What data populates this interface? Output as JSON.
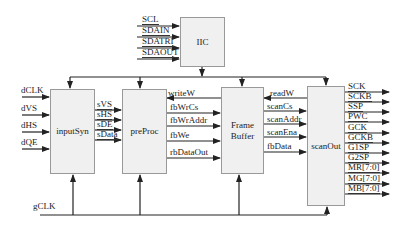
{
  "blocks": {
    "iic": "IIC",
    "inputSyn": "inputSyn",
    "preProc": "preProc",
    "frameBuffer": "Frame\nBuffer",
    "scanOut": "scanOut"
  },
  "iic_inputs": [
    "SCL",
    "SDAIN",
    "SDATRI",
    "SDAOUT"
  ],
  "inputSyn_inputs": [
    "dCLK",
    "dVS",
    "dHS",
    "dQE"
  ],
  "inputSyn_to_preProc": [
    "sVS",
    "sHS",
    "sDE",
    "sData"
  ],
  "preProc_frameBuffer": {
    "feedback": "writeW",
    "outputs": [
      "fbWrCs",
      "fbWrAddr",
      "fbWe",
      "rbDataOut"
    ]
  },
  "frameBuffer_scanOut": {
    "feedback": "readW",
    "signals": [
      "scanCs",
      "scanAddr",
      "scanEna",
      "fbData"
    ]
  },
  "scanOut_outputs": [
    "SCK",
    "SCKB",
    "SSP",
    "PWC",
    "GCK",
    "GCKB",
    "G1SP",
    "G2SP",
    "MR[7:0]",
    "MG[7:0]",
    "MB[7:0]"
  ],
  "clock": "gCLK",
  "colors": {
    "line": "#222222",
    "box_fill": "#f0f0f0",
    "box_border": "#999999"
  }
}
